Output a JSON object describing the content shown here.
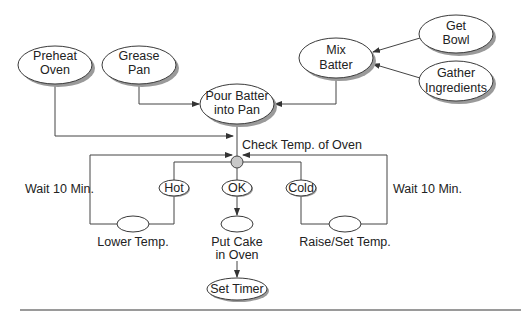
{
  "diagram": {
    "nodes": {
      "preheat_oven": {
        "line1": "Preheat",
        "line2": "Oven"
      },
      "grease_pan": {
        "line1": "Grease",
        "line2": "Pan"
      },
      "pour_batter": {
        "line1": "Pour Batter",
        "line2": "into Pan"
      },
      "mix_batter": {
        "line1": "Mix",
        "line2": "Batter"
      },
      "get_bowl": {
        "line1": "Get",
        "line2": "Bowl"
      },
      "gather_ingredients": {
        "line1": "Gather",
        "line2": "Ingredients"
      },
      "hot": {
        "label": "Hot"
      },
      "ok": {
        "label": "OK"
      },
      "cold": {
        "label": "Cold"
      },
      "set_timer": {
        "label": "Set Timer"
      }
    },
    "labels": {
      "check_temp": "Check Temp. of Oven",
      "wait_left": "Wait 10 Min.",
      "wait_right": "Wait 10 Min.",
      "lower_temp": "Lower Temp.",
      "put_cake_line1": "Put Cake",
      "put_cake_line2": "in Oven",
      "raise_temp": "Raise/Set Temp."
    },
    "colors": {
      "stroke": "#3a3a3a",
      "decision_fill": "#c8c8c8",
      "rule": "#9a9a9a"
    }
  }
}
